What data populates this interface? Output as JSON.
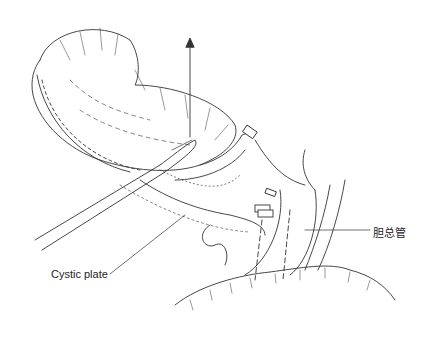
{
  "figure": {
    "labels": {
      "cystic_plate": "Cystic plate",
      "common_bile_duct": "胆总管"
    },
    "colors": {
      "line": "#333333",
      "background": "#ffffff"
    }
  }
}
